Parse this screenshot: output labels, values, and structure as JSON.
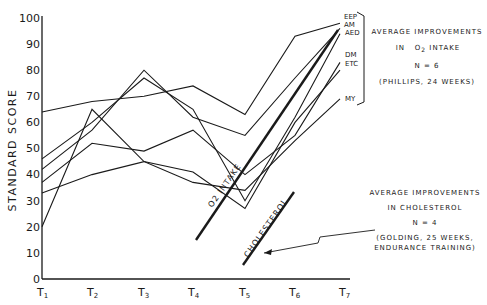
{
  "chart_data": {
    "type": "line",
    "title": "",
    "xlabel": "",
    "ylabel": "STANDARD SCORE",
    "ylim": [
      0,
      100
    ],
    "yticks": [
      0,
      10,
      20,
      30,
      40,
      50,
      60,
      70,
      80,
      90,
      100
    ],
    "categories": [
      "T1",
      "T2",
      "T3",
      "T4",
      "T5",
      "T6",
      "T7"
    ],
    "grid": false,
    "legend": "direct labels at right end of lines",
    "series": [
      {
        "name": "EEP",
        "values": [
          64,
          68,
          70,
          74,
          63,
          93,
          98
        ]
      },
      {
        "name": "AM",
        "values": [
          42,
          57,
          80,
          62,
          55,
          77,
          96
        ]
      },
      {
        "name": "AED",
        "values": [
          46,
          60,
          77,
          65,
          30,
          62,
          94
        ]
      },
      {
        "name": "DM",
        "values": [
          37,
          52,
          49,
          57,
          40,
          55,
          83
        ]
      },
      {
        "name": "ETC",
        "values": [
          20,
          65,
          45,
          41,
          27,
          60,
          80
        ]
      },
      {
        "name": "MY",
        "values": [
          33,
          40,
          45,
          37,
          34,
          53,
          69
        ]
      }
    ],
    "trend_lines": [
      {
        "label": "O2 INTAKE",
        "from": {
          "x": "T4",
          "y": 15
        },
        "to": {
          "x": "T7",
          "y": 95
        }
      },
      {
        "label": "CHOLESTEROL",
        "from": {
          "x": "T5",
          "y": 6
        },
        "to": {
          "x": "T6",
          "y": 34
        }
      }
    ],
    "annotations": [
      {
        "lines": [
          "AVERAGE IMPROVEMENTS",
          "IN O2 INTAKE",
          "N = 6",
          "(PHILLIPS, 24 WEEKS)"
        ]
      },
      {
        "lines": [
          "AVERAGE IMPROVEMENTS",
          "IN CHOLESTEROL",
          "N = 4",
          "(GOLDING, 25 WEEKS,",
          "ENDURANCE TRAINING)"
        ]
      }
    ]
  },
  "axis": {
    "y_title": "STANDARD SCORE",
    "y_ticks": [
      "0",
      "10",
      "20",
      "30",
      "40",
      "50",
      "60",
      "70",
      "80",
      "90",
      "100"
    ],
    "x_ticks": [
      {
        "main": "T",
        "sub": "1"
      },
      {
        "main": "T",
        "sub": "2"
      },
      {
        "main": "T",
        "sub": "3"
      },
      {
        "main": "T",
        "sub": "4"
      },
      {
        "main": "T",
        "sub": "5"
      },
      {
        "main": "T",
        "sub": "6"
      },
      {
        "main": "T",
        "sub": "7"
      }
    ]
  },
  "series_labels": [
    "EEP",
    "AM",
    "AED",
    "DM",
    "ETC",
    "MY"
  ],
  "trend_labels": {
    "o2": "O2 INTAKE",
    "cholesterol": "CHOLESTEROL"
  },
  "annotation_o2": {
    "line1": "AVERAGE IMPROVEMENTS",
    "line2_pre": "IN",
    "line2_o": "O",
    "line2_sub": "2",
    "line2_post": "INTAKE",
    "line3": "N = 6",
    "line4": "(PHILLIPS, 24 WEEKS)"
  },
  "annotation_chol": {
    "line1": "AVERAGE IMPROVEMENTS",
    "line2": "IN CHOLESTEROL",
    "line3": "N = 4",
    "line4": "(GOLDING, 25 WEEKS,",
    "line5": "ENDURANCE TRAINING)"
  }
}
